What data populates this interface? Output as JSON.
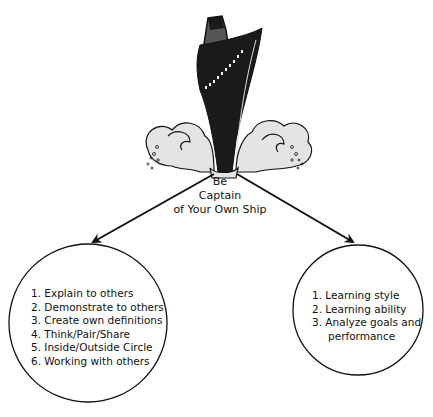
{
  "center": {
    "title_lines": [
      "Be",
      "Captain",
      "of Your Own Ship"
    ]
  },
  "left_circle": {
    "items": [
      "1. Explain to others",
      "2. Demonstrate to others",
      "3. Create own definitions",
      "4. Think/Pair/Share",
      "5. Inside/Outside Circle",
      "6. Working with others"
    ]
  },
  "right_circle": {
    "items": [
      "1. Learning style",
      "2. Learning ability",
      "3. Analyze goals and",
      "performance"
    ]
  },
  "colors": {
    "ship_hull": "#1a1a1a",
    "ship_funnel": "#555555",
    "waves": "#e4e4e4",
    "stroke": "#111111"
  }
}
